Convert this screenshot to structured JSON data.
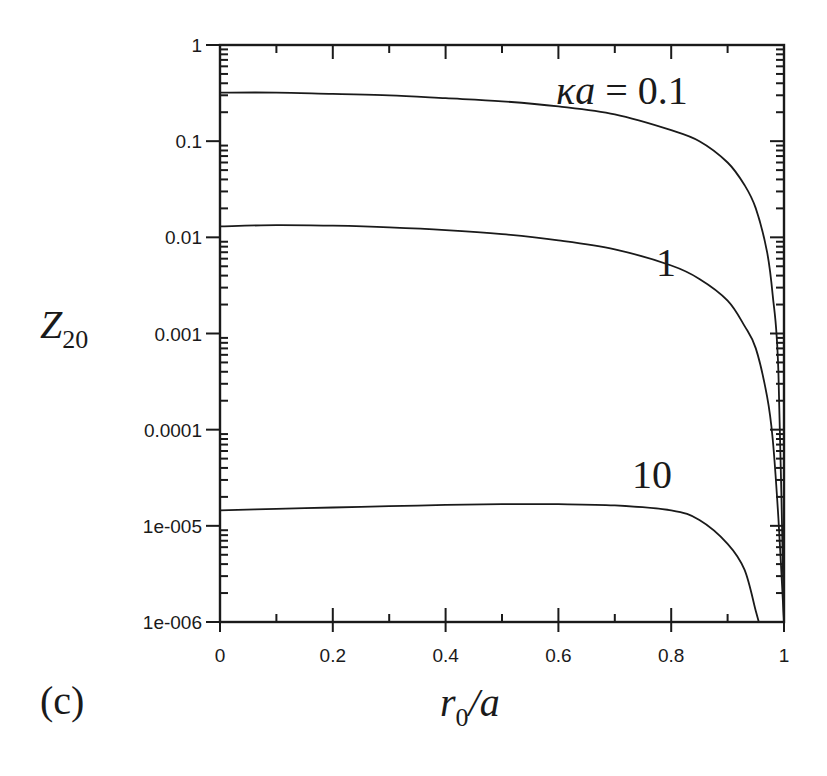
{
  "panel_label": "(c)",
  "chart_data": {
    "type": "line",
    "title": "",
    "xlabel": "r0/a",
    "ylabel": "Z20",
    "xscale": "linear",
    "yscale": "log",
    "xlim": [
      0,
      1
    ],
    "ylim": [
      1e-06,
      1
    ],
    "x_ticks": [
      0,
      0.2,
      0.4,
      0.6,
      0.8,
      1
    ],
    "x_tick_labels": [
      "0",
      "0.2",
      "0.4",
      "0.6",
      "0.8",
      "1"
    ],
    "y_ticks": [
      1,
      0.1,
      0.01,
      0.001,
      0.0001,
      1e-05,
      1e-06
    ],
    "y_tick_labels": [
      "1",
      "0.1",
      "0.01",
      "0.001",
      "0.0001",
      "1e-005",
      "1e-006"
    ],
    "grid": false,
    "legend": "none (curves labeled inline)",
    "annotations": [
      {
        "text": "κa = 0.1",
        "near_series": "κa = 0.1",
        "position": [
          0.75,
          0.5
        ]
      },
      {
        "text": "1",
        "near_series": "κa = 1",
        "position": [
          0.74,
          0.005
        ]
      },
      {
        "text": "10",
        "near_series": "κa = 10",
        "position": [
          0.74,
          2.3e-05
        ]
      }
    ],
    "x": [
      0,
      0.1,
      0.2,
      0.3,
      0.4,
      0.5,
      0.6,
      0.7,
      0.8,
      0.85,
      0.9,
      0.93,
      0.95,
      0.97,
      0.98,
      0.99,
      1.0
    ],
    "series": [
      {
        "name": "κa = 0.1",
        "values": [
          0.32,
          0.32,
          0.31,
          0.3,
          0.28,
          0.26,
          0.23,
          0.19,
          0.13,
          0.1,
          0.06,
          0.035,
          0.02,
          0.007,
          0.0025,
          0.0004,
          1e-06
        ]
      },
      {
        "name": "κa = 1",
        "values": [
          0.013,
          0.0134,
          0.0132,
          0.0127,
          0.0119,
          0.0108,
          0.0093,
          0.0075,
          0.0051,
          0.0037,
          0.0022,
          0.0012,
          0.0007,
          0.00022,
          8e-05,
          1.2e-05,
          1e-06
        ]
      },
      {
        "name": "κa = 10",
        "values": [
          1.45e-05,
          1.5e-05,
          1.55e-05,
          1.6e-05,
          1.65e-05,
          1.68e-05,
          1.68e-05,
          1.63e-05,
          1.45e-05,
          1.15e-05,
          6.5e-06,
          3.5e-06,
          1.3e-06,
          null,
          null,
          null,
          null
        ]
      }
    ]
  }
}
